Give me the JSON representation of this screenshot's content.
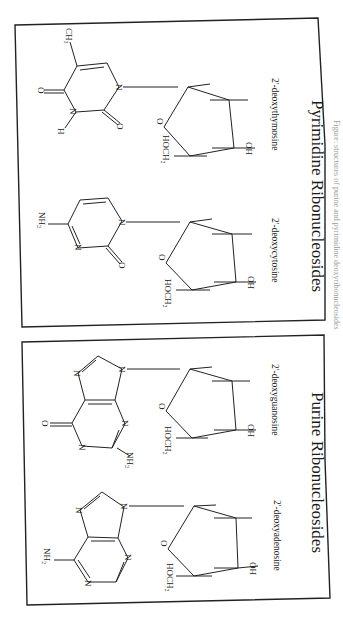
{
  "figure": {
    "orientation": "rotated-90-clockwise",
    "caption": "Figure: structures of purine and pyrimidine deoxyribonucleosides",
    "panels": [
      {
        "id": "pyrimidine",
        "title": "Pyrimidine Ribonucleosides",
        "compounds": [
          {
            "name": "2'-deoxythymosine",
            "base_labels": {
              "methyl": "CH₃",
              "carbonyl_top": "O",
              "carbonyl_bottom": "O",
              "nh": "N",
              "h": "H",
              "n1": "N"
            },
            "sugar_labels": {
              "ring_o": "O",
              "hoch2": "HOCH₂",
              "oh": "OH"
            }
          },
          {
            "name": "2'-deoxycytosine",
            "base_labels": {
              "amine": "NH₂",
              "n3": "N",
              "n1": "N",
              "carbonyl": "O"
            },
            "sugar_labels": {
              "ring_o": "O",
              "hoch2": "HOCH₂",
              "oh": "OH"
            }
          }
        ]
      },
      {
        "id": "purine",
        "title": "Purine Ribonucleosides",
        "compounds": [
          {
            "name": "2'-deoxyguanosine",
            "base_labels": {
              "carbonyl": "O",
              "n7": "N",
              "n9": "N",
              "n3": "N",
              "n1": "N",
              "amine": "NH₂"
            },
            "sugar_labels": {
              "ring_o": "O",
              "hoch2": "HOCH₂",
              "oh": "OH"
            }
          },
          {
            "name": "2'-deoxyadenosine",
            "base_labels": {
              "amine": "NH₂",
              "n7": "N",
              "n9": "N",
              "n3": "N",
              "n1": "N"
            },
            "sugar_labels": {
              "ring_o": "O",
              "hoch2": "HOCH₂",
              "oh": "OH"
            }
          }
        ]
      }
    ]
  },
  "colors": {
    "ink": "#222222",
    "background": "#ffffff",
    "caption": "#9a9a9a"
  }
}
